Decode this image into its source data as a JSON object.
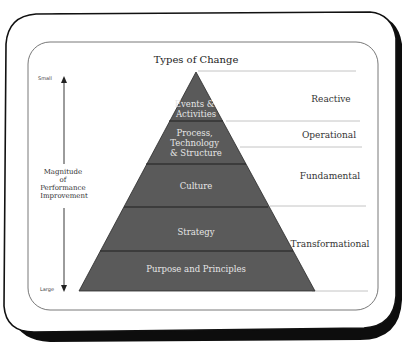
{
  "diagram": {
    "title": "Types of Change",
    "axis": {
      "top_label": "Small",
      "bottom_label": "Large",
      "label_lines": [
        "Magnitude",
        "of",
        "Performance",
        "Improvement"
      ]
    },
    "layers": [
      {
        "lines": [
          "Events &",
          "Activities"
        ]
      },
      {
        "lines": [
          "Process,",
          "Technology",
          "& Structure"
        ]
      },
      {
        "lines": [
          "Culture"
        ]
      },
      {
        "lines": [
          "Strategy"
        ]
      },
      {
        "lines": [
          "Purpose and Principles"
        ]
      }
    ],
    "change_types": [
      {
        "label": "Reactive"
      },
      {
        "label": "Operational"
      },
      {
        "label": "Fundamental"
      },
      {
        "label": "Transformational"
      }
    ],
    "colors": {
      "pyramid_fill": "#5a5a5a",
      "separator": "#1e1e1e",
      "frame_shadow": "#0d0d0d",
      "guide_line": "#b5b5b5"
    }
  }
}
